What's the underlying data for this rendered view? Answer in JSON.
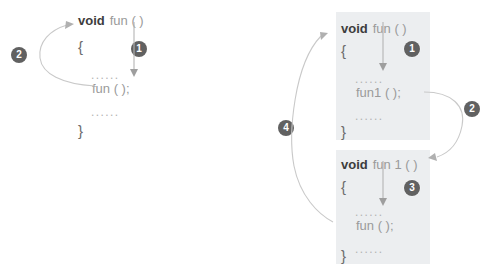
{
  "figure": {
    "background_color": "#ffffff",
    "block_background_color": "#eceef0",
    "badge_color": "#616161",
    "badge_text_color": "#ffffff",
    "arrow_color": "#c9c9c9",
    "keyword_color": "#3d3d3d",
    "identifier_color": "#9a9a9a"
  },
  "left_diagram": {
    "name": "direct-recursion",
    "code": {
      "signature_keyword": "void",
      "signature_name": "fun ( )",
      "open_brace": "{",
      "ellipsis_top": "......",
      "call_statement": "fun ( );",
      "ellipsis_bottom": "......",
      "close_brace": "}"
    },
    "badges": [
      {
        "label": "1",
        "meaning": "enter-function-body"
      },
      {
        "label": "2",
        "meaning": "recursive-call-back-to-fun"
      }
    ]
  },
  "right_diagram": {
    "name": "indirect-recursion",
    "blocks": [
      {
        "name": "function-fun",
        "signature_keyword": "void",
        "signature_name": "fun ( )",
        "open_brace": "{",
        "ellipsis_top": "......",
        "call_statement": "fun1 ( );",
        "ellipsis_bottom": "......",
        "close_brace": "}"
      },
      {
        "name": "function-fun1",
        "signature_keyword": "void",
        "signature_name": "fun 1 ( )",
        "open_brace": "{",
        "ellipsis_top": "......",
        "call_statement": "fun ( );",
        "ellipsis_bottom": "......",
        "close_brace": "}"
      }
    ],
    "badges": [
      {
        "label": "1",
        "meaning": "enter-fun-body"
      },
      {
        "label": "2",
        "meaning": "fun-calls-fun1"
      },
      {
        "label": "3",
        "meaning": "enter-fun1-body"
      },
      {
        "label": "4",
        "meaning": "fun1-calls-fun"
      }
    ]
  }
}
